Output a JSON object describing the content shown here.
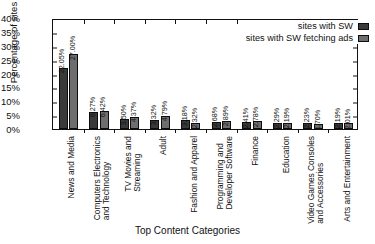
{
  "chart_data": {
    "type": "bar",
    "title": "",
    "xlabel": "Top Content Categories",
    "ylabel": "Percentage of sites",
    "ylim": [
      0,
      40
    ],
    "yticks": [
      "0%",
      "5%",
      "10%",
      "15%",
      "20%",
      "25%",
      "30%",
      "35%",
      "40%"
    ],
    "ytick_values": [
      0,
      5,
      10,
      15,
      20,
      25,
      30,
      35,
      40
    ],
    "grid": false,
    "legend_position": "top-right",
    "categories": [
      "News and Media",
      "Computers Electronics and Technology",
      "TV Movies and Streaming",
      "Adult",
      "Fashion and Apparel",
      "Programming and Developer Software",
      "Finance",
      "Education",
      "Video Games Consoles and Accessories",
      "Arts and Entertainment"
    ],
    "category_lines": [
      [
        "News and Media"
      ],
      [
        "Computers Electronics",
        "and Technology"
      ],
      [
        "TV Movies and",
        "Streaming"
      ],
      [
        "Adult"
      ],
      [
        "Fashion and Apparel"
      ],
      [
        "Programming and",
        "Developer Software"
      ],
      [
        "Finance"
      ],
      [
        "Education"
      ],
      [
        "Video Games Consoles",
        "and Accessories"
      ],
      [
        "Arts and Entertainment"
      ]
    ],
    "series": [
      {
        "name": "sites with SW",
        "color": "#3a3a3a",
        "values": [
          22.05,
          6.27,
          3.5,
          3.32,
          3.18,
          2.68,
          2.41,
          2.29,
          2.23,
          2.19
        ],
        "labels": [
          "22.05%",
          "6.27%",
          "3.50%",
          "3.32%",
          "3.18%",
          "2.68%",
          "2.41%",
          "2.29%",
          "2.23%",
          "2.19%"
        ]
      },
      {
        "name": "sites with SW fetching ads",
        "color": "#6e6e6e",
        "values": [
          27.0,
          6.42,
          4.37,
          4.79,
          2.32,
          2.89,
          2.78,
          2.19,
          1.7,
          2.01
        ],
        "labels": [
          "27.00%",
          "6.42%",
          "4.37%",
          "4.79%",
          "2.32%",
          "2.89%",
          "2.78%",
          "2.19%",
          "1.70%",
          "2.01%"
        ]
      }
    ]
  }
}
